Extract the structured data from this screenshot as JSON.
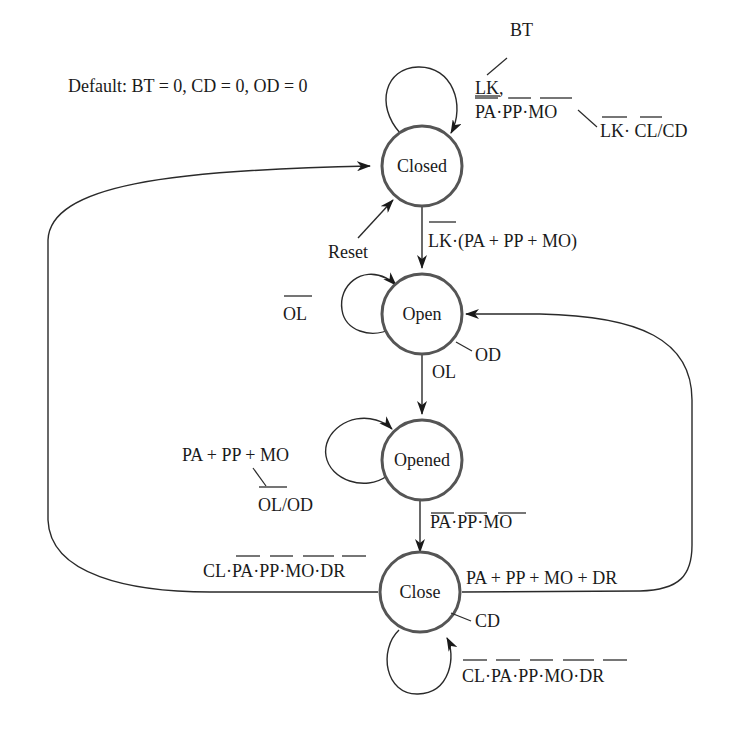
{
  "defaults_note": "Default: BT = 0, CD = 0, OD = 0",
  "states": [
    {
      "id": "closed",
      "label": "Closed"
    },
    {
      "id": "open",
      "label": "Open"
    },
    {
      "id": "opened",
      "label": "Opened"
    },
    {
      "id": "close",
      "label": "Close"
    }
  ],
  "reset_label": "Reset",
  "outputs": {
    "closed_bt": "BT",
    "closed_cd": "LK· CL/CD",
    "open_od": "OD",
    "opened_od": "OL/OD",
    "close_cd": "CD"
  },
  "transitions": {
    "closed_self_line1": "LK,",
    "closed_self_line2": "PA·PP·MO",
    "closed_to_open": "LK·(PA + PP + MO)",
    "open_self": "OL",
    "open_to_opened": "OL",
    "opened_self": "PA + PP + MO",
    "opened_to_close": "PA·PP·MO",
    "close_to_closed": "CL·PA·PP·MO·DR",
    "close_to_open": "PA + PP + MO + DR",
    "close_self": "CL·PA·PP·MO·DR"
  },
  "colors": {
    "state_stroke": "#555555",
    "edge": "#2a2a2a",
    "text": "#1a1a1a",
    "background": "#ffffff"
  }
}
